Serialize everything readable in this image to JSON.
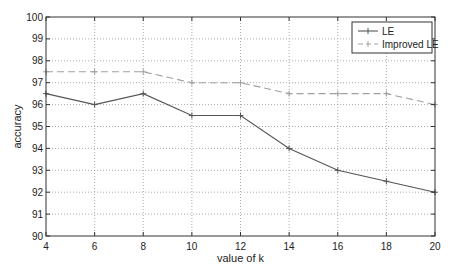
{
  "chart_data": {
    "type": "line",
    "title": "",
    "xlabel": "value of k",
    "ylabel": "accuracy",
    "x": [
      4,
      6,
      8,
      10,
      12,
      14,
      16,
      18,
      20
    ],
    "xlim": [
      4,
      20
    ],
    "ylim": [
      90,
      100
    ],
    "xticks": [
      4,
      6,
      8,
      10,
      12,
      14,
      16,
      18,
      20
    ],
    "yticks": [
      90,
      91,
      92,
      93,
      94,
      95,
      96,
      97,
      98,
      99,
      100
    ],
    "grid": true,
    "legend_position": "upper right",
    "series": [
      {
        "name": "LE",
        "values": [
          96.5,
          96,
          96.5,
          95.5,
          95.5,
          94,
          93,
          92.5,
          92
        ],
        "line_style": "solid",
        "marker": "+",
        "color": "#555555"
      },
      {
        "name": "Improved LE",
        "values": [
          97.5,
          97.5,
          97.5,
          97,
          97,
          96.5,
          96.5,
          96.5,
          96
        ],
        "line_style": "dashed",
        "marker": "+",
        "color": "#a0a0a0"
      }
    ]
  },
  "legend": {
    "items": [
      "LE",
      "Improved LE"
    ]
  },
  "colors": {
    "axis": "#333333",
    "grid": "#888888",
    "le": "#555555",
    "improved_le": "#a0a0a0"
  }
}
